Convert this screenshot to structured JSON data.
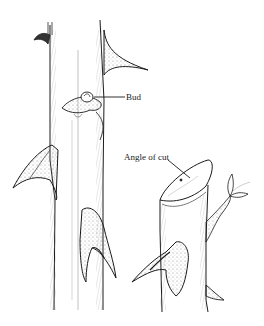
{
  "illustration": {
    "subject": "rose stem pruning",
    "labels": {
      "bud": "Bud",
      "angle_of_cut": "Angle of cut"
    },
    "colors": {
      "ink": "#1a1a1a",
      "shade": "#7a7a7a",
      "background": "#ffffff"
    }
  }
}
